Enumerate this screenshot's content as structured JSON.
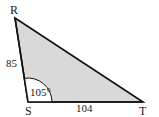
{
  "diagram": {
    "type": "triangle",
    "fill_color": "#d9d9d9",
    "stroke_color": "#111111",
    "vertices": {
      "R": {
        "label": "R",
        "x": 15,
        "y": 18
      },
      "S": {
        "label": "S",
        "x": 28,
        "y": 102
      },
      "T": {
        "label": "T",
        "x": 143,
        "y": 102
      }
    },
    "sides": {
      "RS": {
        "label": "85"
      },
      "ST": {
        "label": "104"
      }
    },
    "angles": {
      "S": {
        "label": "105°"
      }
    }
  }
}
